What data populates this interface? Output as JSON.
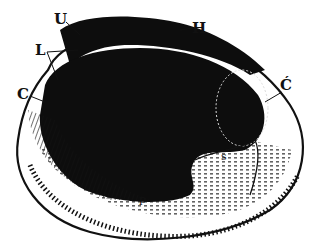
{
  "figure": {
    "colors": {
      "ink": "#111111",
      "paper": "#ffffff"
    },
    "labels": [
      {
        "id": "U",
        "text": "U",
        "x": 54,
        "y": 12
      },
      {
        "id": "H",
        "text": "H",
        "x": 192,
        "y": 21
      },
      {
        "id": "L",
        "text": "L",
        "x": 35,
        "y": 43
      },
      {
        "id": "C",
        "text": "C",
        "x": 17,
        "y": 87
      },
      {
        "id": "C-prime",
        "text": "Ć",
        "x": 280,
        "y": 78
      },
      {
        "id": "s",
        "text": "s",
        "x": 221,
        "y": 151
      },
      {
        "id": "p",
        "text": "p",
        "x": 139,
        "y": 194
      }
    ]
  }
}
